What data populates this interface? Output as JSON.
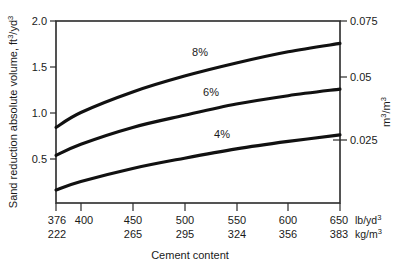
{
  "chart_data": {
    "type": "line",
    "title": "",
    "xlabel": "Cement content",
    "ylabel": "Sand reduction absolute volume, ft³/yd³",
    "ylabel_right": "m³/m³",
    "xlim": [
      376,
      650
    ],
    "ylim": [
      0.05,
      2.0
    ],
    "ylim_right": [
      0.0014,
      0.0556
    ],
    "grid": false,
    "legend": "inline-curve-labels",
    "x_unit_primary": "lb/yd³",
    "x_unit_secondary": "kg/m³",
    "xticks_primary": [
      "376",
      "400",
      "450",
      "500",
      "550",
      "600",
      "650"
    ],
    "xticks_primary_values": [
      376,
      400,
      450,
      500,
      550,
      600,
      650
    ],
    "xticks_secondary": [
      "222",
      "",
      "265",
      "295",
      "324",
      "356",
      "383"
    ],
    "xticks_secondary_values": [
      222,
      null,
      265,
      295,
      324,
      356,
      383
    ],
    "yticks_left": [
      "2.0",
      "1.5",
      "1.0",
      "0.5"
    ],
    "yticks_left_values": [
      2.0,
      1.5,
      1.0,
      0.5
    ],
    "yticks_right": [
      "0.075",
      "0.05",
      "0.025"
    ],
    "yticks_right_values": [
      0.075,
      0.05,
      0.025
    ],
    "series": [
      {
        "name": "8%",
        "label": "8%",
        "x": [
          376,
          400,
          450,
          500,
          550,
          600,
          650
        ],
        "values": [
          0.86,
          1.02,
          1.24,
          1.41,
          1.55,
          1.67,
          1.76
        ]
      },
      {
        "name": "6%",
        "label": "6%",
        "x": [
          376,
          400,
          450,
          500,
          550,
          600,
          650
        ],
        "values": [
          0.56,
          0.68,
          0.86,
          0.99,
          1.11,
          1.2,
          1.27
        ]
      },
      {
        "name": "4%",
        "label": "4%",
        "x": [
          376,
          400,
          450,
          500,
          550,
          600,
          650
        ],
        "values": [
          0.19,
          0.28,
          0.42,
          0.53,
          0.63,
          0.71,
          0.78
        ]
      }
    ]
  },
  "axis": {
    "y_left_title_main": "Sand reduction absolute volume, ft",
    "y_left_title_sup1": "3",
    "y_left_title_mid": "/yd",
    "y_left_title_sup2": "3",
    "y_right_title_main": "m",
    "y_right_title_sup1": "3",
    "y_right_title_mid": "/m",
    "y_right_title_sup2": "3",
    "x_title": "Cement content",
    "x_unit_primary_main": "lb/yd",
    "x_unit_primary_sup": "3",
    "x_unit_secondary_main": "kg/m",
    "x_unit_secondary_sup": "3"
  },
  "colors": {
    "background": "#ffffff",
    "frame": "#2a2a2a",
    "curve": "#111111",
    "text": "#1a1a1a"
  }
}
